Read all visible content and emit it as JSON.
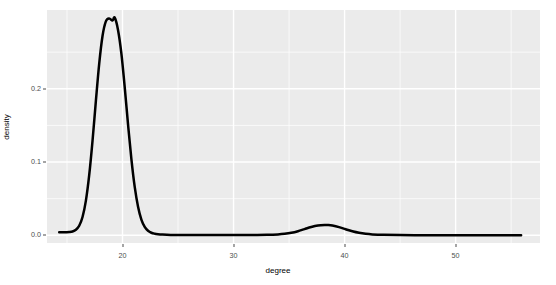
{
  "chart_data": {
    "type": "line",
    "title": "",
    "subtitle": "",
    "xlabel": "degree",
    "ylabel": "density",
    "xlim": [
      13.2,
      57.6
    ],
    "ylim": [
      -0.0105,
      0.3075
    ],
    "xticks": [
      20,
      30,
      40,
      50
    ],
    "xtick_labels": [
      "20",
      "30",
      "40",
      "50"
    ],
    "yticks": [
      0.0,
      0.1,
      0.2
    ],
    "ytick_labels": [
      "0.0",
      "0.1",
      "0.2"
    ],
    "x_minor_ticks": [
      15,
      25,
      35,
      45,
      55
    ],
    "y_minor_ticks": [
      0.05,
      0.15,
      0.25
    ],
    "grid": true,
    "legend": "none",
    "panel_background": "#ebebeb",
    "grid_color": "#ffffff",
    "line_color": "#000000",
    "line_width": 2.5,
    "series": [
      {
        "name": "density",
        "x": [
          14.3,
          14.6,
          14.9,
          15.2,
          15.5,
          15.8,
          16.1,
          16.4,
          16.7,
          17.0,
          17.3,
          17.6,
          17.9,
          18.2,
          18.5,
          18.8,
          19.1,
          19.3,
          19.6,
          19.9,
          20.2,
          20.5,
          20.8,
          21.1,
          21.4,
          21.7,
          22.0,
          22.3,
          22.6,
          22.9,
          23.2,
          23.6,
          24.0,
          24.5,
          25.0,
          26.0,
          27.0,
          28.0,
          29.0,
          30.0,
          31.0,
          32.0,
          33.0,
          34.0,
          34.6,
          35.2,
          35.8,
          36.4,
          37.0,
          37.6,
          38.2,
          38.5,
          38.9,
          39.5,
          40.1,
          40.7,
          41.3,
          41.9,
          42.5,
          43.5,
          45.0,
          47.0,
          49.0,
          51.0,
          53.0,
          55.0,
          55.9
        ],
        "y": [
          0.0042,
          0.0042,
          0.0043,
          0.0045,
          0.0052,
          0.0075,
          0.013,
          0.025,
          0.047,
          0.082,
          0.129,
          0.183,
          0.234,
          0.272,
          0.292,
          0.296,
          0.293,
          0.297,
          0.28,
          0.248,
          0.202,
          0.151,
          0.104,
          0.066,
          0.039,
          0.0215,
          0.0115,
          0.0062,
          0.0035,
          0.0022,
          0.0015,
          0.001,
          0.0007,
          0.0005,
          0.0004,
          0.0003,
          0.0003,
          0.0003,
          0.0003,
          0.0003,
          0.0003,
          0.0004,
          0.0006,
          0.0012,
          0.002,
          0.0034,
          0.0056,
          0.0085,
          0.0113,
          0.0133,
          0.0141,
          0.014,
          0.0133,
          0.0112,
          0.0082,
          0.0055,
          0.0034,
          0.002,
          0.0012,
          0.0006,
          0.0003,
          0.0002,
          0.0001,
          0.0001,
          0.0001,
          0.0001,
          0.0001
        ]
      }
    ]
  },
  "axes": {
    "x": {
      "title": "degree",
      "ticks": [
        {
          "value": 20,
          "label": "20"
        },
        {
          "value": 30,
          "label": "30"
        },
        {
          "value": 40,
          "label": "40"
        },
        {
          "value": 50,
          "label": "50"
        }
      ]
    },
    "y": {
      "title": "density",
      "ticks": [
        {
          "value": 0.0,
          "label": "0.0"
        },
        {
          "value": 0.1,
          "label": "0.1"
        },
        {
          "value": 0.2,
          "label": "0.2"
        }
      ]
    }
  }
}
